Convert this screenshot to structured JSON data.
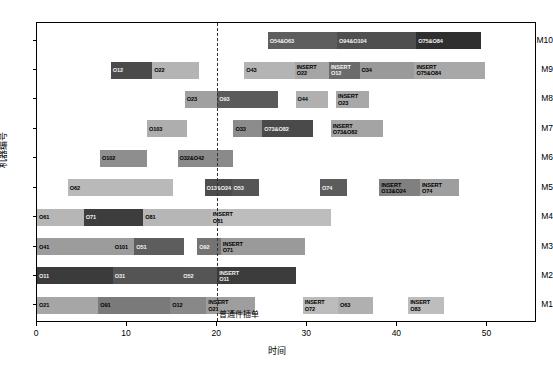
{
  "chart_data": {
    "type": "bar",
    "subtype": "gantt",
    "title": "",
    "xlabel": "时间",
    "ylabel": "机器编号",
    "xlim": [
      0,
      55.5
    ],
    "ylim": [
      0.4,
      10.6
    ],
    "xticks": [
      0,
      10,
      20,
      30,
      40,
      50
    ],
    "xtick_labels": [
      "0",
      "10",
      "20",
      "30",
      "40",
      "50"
    ],
    "categories": [
      "M1",
      "M2",
      "M3",
      "M4",
      "M5",
      "M6",
      "M7",
      "M8",
      "M9",
      "M10"
    ],
    "grid": false,
    "legend": "none",
    "annotations": [
      {
        "name": "insert-event-line",
        "type": "vline",
        "x": 20,
        "style": "dashed",
        "color": "#333333",
        "text": "普通件插单"
      }
    ],
    "machines": [
      {
        "machine": "M10",
        "row": 10,
        "tasks": [
          {
            "label": "O54&O63",
            "start": 25.6,
            "end": 33.3,
            "color": "#5e5e5e",
            "light_text": true
          },
          {
            "label": "O94&O104",
            "start": 33.3,
            "end": 42.1,
            "color": "#4f4f4f",
            "light_text": true
          },
          {
            "label": "O75&O84",
            "start": 42.1,
            "end": 49.3,
            "color": "#2f2f2f",
            "light_text": true
          }
        ]
      },
      {
        "machine": "M9",
        "row": 9,
        "tasks": [
          {
            "label": "O12",
            "start": 8.2,
            "end": 12.8,
            "color": "#4a4a4a",
            "light_text": true
          },
          {
            "label": "O22",
            "start": 12.8,
            "end": 18.0,
            "color": "#b4b4b4",
            "light_text": false
          },
          {
            "label": "O43",
            "start": 23.0,
            "end": 28.6,
            "color": "#b4b4b4",
            "light_text": false
          },
          {
            "label": "INSERT\nO22",
            "start": 28.6,
            "end": 32.4,
            "color": "#a6a6a6",
            "light_text": false
          },
          {
            "label": "INSERT\nO12",
            "start": 32.4,
            "end": 35.8,
            "color": "#6b6b6b",
            "light_text": true
          },
          {
            "label": "O34",
            "start": 35.8,
            "end": 41.9,
            "color": "#9a9a9a",
            "light_text": false
          },
          {
            "label": "INSERT\nO75&O84",
            "start": 41.9,
            "end": 49.7,
            "color": "#a8a8a8",
            "light_text": false
          }
        ]
      },
      {
        "machine": "M8",
        "row": 8,
        "tasks": [
          {
            "label": "O23",
            "start": 16.4,
            "end": 20.0,
            "color": "#a0a0a0",
            "light_text": false
          },
          {
            "label": "O93",
            "start": 20.0,
            "end": 26.8,
            "color": "#5a5a5a",
            "light_text": true
          },
          {
            "label": "O44",
            "start": 28.7,
            "end": 32.3,
            "color": "#b0b0b0",
            "light_text": false
          },
          {
            "label": "INSERT\nO23",
            "start": 33.2,
            "end": 36.8,
            "color": "#a8a8a8",
            "light_text": false
          }
        ]
      },
      {
        "machine": "M7",
        "row": 7,
        "tasks": [
          {
            "label": "O103",
            "start": 12.2,
            "end": 16.6,
            "color": "#aeaeae",
            "light_text": false
          },
          {
            "label": "O33",
            "start": 21.8,
            "end": 25.0,
            "color": "#8c8c8c",
            "light_text": false
          },
          {
            "label": "O73&O82",
            "start": 25.0,
            "end": 30.6,
            "color": "#4a4a4a",
            "light_text": true
          },
          {
            "label": "INSERT\nO73&O82",
            "start": 32.6,
            "end": 38.4,
            "color": "#a4a4a4",
            "light_text": false
          }
        ]
      },
      {
        "machine": "M6",
        "row": 6,
        "tasks": [
          {
            "label": "O102",
            "start": 7.0,
            "end": 12.2,
            "color": "#8e8e8e",
            "light_text": false
          },
          {
            "label": "O32&O42",
            "start": 15.6,
            "end": 21.8,
            "color": "#8a8a8a",
            "light_text": false
          }
        ]
      },
      {
        "machine": "M5",
        "row": 5,
        "tasks": [
          {
            "label": "O62",
            "start": 3.4,
            "end": 15.1,
            "color": "#b9b9b9",
            "light_text": false
          },
          {
            "label": "O13&O24",
            "start": 18.6,
            "end": 21.6,
            "color": "#4d4d4d",
            "light_text": true
          },
          {
            "label": "O53",
            "start": 21.6,
            "end": 24.6,
            "color": "#555555",
            "light_text": true
          },
          {
            "label": "O74",
            "start": 31.4,
            "end": 34.4,
            "color": "#5c5c5c",
            "light_text": true
          },
          {
            "label": "INSERT\nO13&O24",
            "start": 38.0,
            "end": 42.5,
            "color": "#808080",
            "light_text": false
          },
          {
            "label": "INSERT\nO74",
            "start": 42.5,
            "end": 46.8,
            "color": "#9e9e9e",
            "light_text": false
          }
        ]
      },
      {
        "machine": "M4",
        "row": 4,
        "tasks": [
          {
            "label": "O61",
            "start": 0.0,
            "end": 5.2,
            "color": "#b6b6b6",
            "light_text": false
          },
          {
            "label": "O71",
            "start": 5.2,
            "end": 11.8,
            "color": "#3d3d3d",
            "light_text": true
          },
          {
            "label": "O81",
            "start": 11.8,
            "end": 19.3,
            "color": "#b6b6b6",
            "light_text": false
          },
          {
            "label": "INSERT\nO81",
            "start": 19.3,
            "end": 32.6,
            "color": "#bdbdbd",
            "light_text": false
          }
        ]
      },
      {
        "machine": "M3",
        "row": 3,
        "tasks": [
          {
            "label": "O41",
            "start": 0.0,
            "end": 8.4,
            "color": "#9c9c9c",
            "light_text": false
          },
          {
            "label": "O101",
            "start": 8.4,
            "end": 10.8,
            "color": "#9c9c9c",
            "light_text": false
          },
          {
            "label": "O51",
            "start": 10.8,
            "end": 16.3,
            "color": "#5d5d5d",
            "light_text": true
          },
          {
            "label": "O92",
            "start": 17.8,
            "end": 20.4,
            "color": "#747474",
            "light_text": true
          },
          {
            "label": "INSERT\nO71",
            "start": 20.4,
            "end": 29.7,
            "color": "#9a9a9a",
            "light_text": false
          }
        ]
      },
      {
        "machine": "M2",
        "row": 2,
        "tasks": [
          {
            "label": "O11",
            "start": 0.0,
            "end": 8.4,
            "color": "#3b3b3b",
            "light_text": true
          },
          {
            "label": "O31",
            "start": 8.4,
            "end": 16.0,
            "color": "#545454",
            "light_text": true
          },
          {
            "label": "O52",
            "start": 16.0,
            "end": 20.0,
            "color": "#555555",
            "light_text": true
          },
          {
            "label": "INSERT\nO11",
            "start": 20.0,
            "end": 28.8,
            "color": "#3c3c3c",
            "light_text": true
          }
        ]
      },
      {
        "machine": "M1",
        "row": 1,
        "tasks": [
          {
            "label": "O21",
            "start": 0.0,
            "end": 6.8,
            "color": "#a6a6a6",
            "light_text": false
          },
          {
            "label": "O91",
            "start": 6.8,
            "end": 14.8,
            "color": "#7a7a7a",
            "light_text": false
          },
          {
            "label": "O12",
            "start": 14.8,
            "end": 18.8,
            "color": "#888888",
            "light_text": false
          },
          {
            "label": "INSERT\nO21",
            "start": 18.8,
            "end": 24.2,
            "color": "#9e9e9e",
            "light_text": false
          },
          {
            "label": "INSERT\nO72",
            "start": 29.5,
            "end": 33.4,
            "color": "#bcbcbc",
            "light_text": false
          },
          {
            "label": "O63",
            "start": 33.4,
            "end": 37.3,
            "color": "#b0b0b0",
            "light_text": false
          },
          {
            "label": "INSERT\nO83",
            "start": 41.2,
            "end": 45.2,
            "color": "#bdbdbd",
            "light_text": false
          }
        ]
      }
    ]
  }
}
